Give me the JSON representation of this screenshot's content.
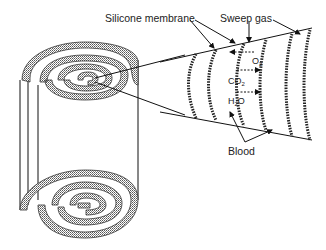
{
  "figure": {
    "labels": {
      "silicone_membrane": "Silicone membrane",
      "sweep_gas": "Sweep gas",
      "blood": "Blood"
    },
    "gases": {
      "o2": {
        "base": "O",
        "sub": "2",
        "direction": "left"
      },
      "co2": {
        "base": "CO",
        "sub": "2",
        "direction": "right"
      },
      "h2o": {
        "base": "H",
        "sub": "2",
        "post": "O",
        "direction": "right"
      }
    },
    "colors": {
      "line": "#111111",
      "membrane_fill": "#cfcfcf",
      "background": "#ffffff"
    }
  }
}
